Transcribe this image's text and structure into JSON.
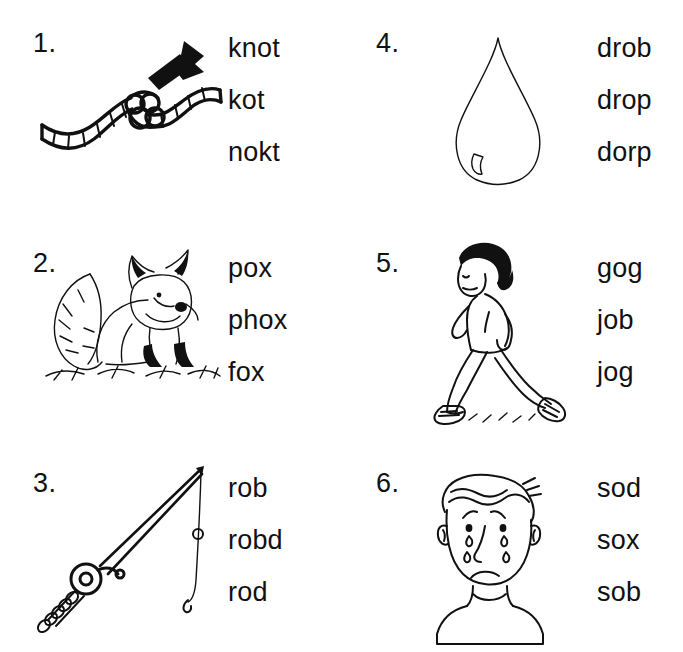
{
  "worksheet": {
    "title": "Phonics Word Choice Worksheet",
    "background_color": "#ffffff",
    "ink_color": "#111111"
  },
  "items": [
    {
      "number": "1.",
      "picture": "knotted-rope-with-arrow",
      "choices": [
        "knot",
        "kot",
        "nokt"
      ]
    },
    {
      "number": "4.",
      "picture": "water-drop",
      "choices": [
        "drob",
        "drop",
        "dorp"
      ]
    },
    {
      "number": "2.",
      "picture": "fox-sitting-on-grass",
      "choices": [
        "pox",
        "phox",
        "fox"
      ]
    },
    {
      "number": "5.",
      "picture": "person-jogging",
      "choices": [
        "gog",
        "job",
        "jog"
      ]
    },
    {
      "number": "3.",
      "picture": "fishing-rod-with-line",
      "choices": [
        "rob",
        "robd",
        "rod"
      ]
    },
    {
      "number": "6.",
      "picture": "crying-boy-face",
      "choices": [
        "sod",
        "sox",
        "sob"
      ]
    }
  ]
}
